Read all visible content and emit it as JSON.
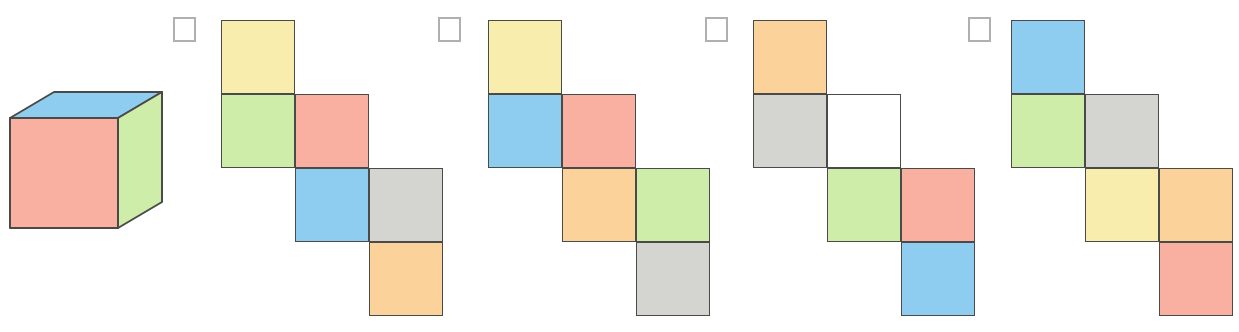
{
  "page": {
    "clipped_header_text": "",
    "square_size_px": 74,
    "option_count": 4
  },
  "palette": {
    "yellow": "#f8edad",
    "green": "#cdeda8",
    "pink": "#f9b0a1",
    "blue": "#8fcdf0",
    "gray": "#d4d4d0",
    "orange": "#fbd29a",
    "white": "#ffffff",
    "outline": "#4a4a48",
    "checkbox_border": "#b0b0ae"
  },
  "cube": {
    "name": "reference-cube",
    "faces": {
      "top": "blue",
      "front": "pink",
      "right": "green"
    },
    "position": {
      "x": 8,
      "y": 90,
      "width": 160,
      "height": 152
    }
  },
  "options": [
    {
      "id": "option-a",
      "checkbox": {
        "x": 173,
        "y": 17,
        "checked": false
      },
      "net_origin": {
        "x": 221,
        "y": 20
      },
      "cells": [
        {
          "row": 0,
          "col": 0,
          "color": "yellow"
        },
        {
          "row": 1,
          "col": 0,
          "color": "green"
        },
        {
          "row": 1,
          "col": 1,
          "color": "pink"
        },
        {
          "row": 2,
          "col": 1,
          "color": "blue"
        },
        {
          "row": 2,
          "col": 2,
          "color": "gray"
        },
        {
          "row": 3,
          "col": 2,
          "color": "orange"
        }
      ]
    },
    {
      "id": "option-b",
      "checkbox": {
        "x": 438,
        "y": 17,
        "checked": false
      },
      "net_origin": {
        "x": 488,
        "y": 20
      },
      "cells": [
        {
          "row": 0,
          "col": 0,
          "color": "yellow"
        },
        {
          "row": 1,
          "col": 0,
          "color": "blue"
        },
        {
          "row": 1,
          "col": 1,
          "color": "pink"
        },
        {
          "row": 2,
          "col": 1,
          "color": "orange"
        },
        {
          "row": 2,
          "col": 2,
          "color": "green"
        },
        {
          "row": 3,
          "col": 2,
          "color": "gray"
        }
      ]
    },
    {
      "id": "option-c",
      "checkbox": {
        "x": 705,
        "y": 17,
        "checked": false
      },
      "net_origin": {
        "x": 753,
        "y": 20
      },
      "cells": [
        {
          "row": 0,
          "col": 0,
          "color": "orange"
        },
        {
          "row": 1,
          "col": 0,
          "color": "gray"
        },
        {
          "row": 1,
          "col": 1,
          "color": "white"
        },
        {
          "row": 2,
          "col": 1,
          "color": "green"
        },
        {
          "row": 2,
          "col": 2,
          "color": "pink"
        },
        {
          "row": 3,
          "col": 2,
          "color": "blue"
        }
      ]
    },
    {
      "id": "option-d",
      "checkbox": {
        "x": 968,
        "y": 17,
        "checked": false
      },
      "net_origin": {
        "x": 1011,
        "y": 20
      },
      "cells": [
        {
          "row": 0,
          "col": 0,
          "color": "blue"
        },
        {
          "row": 1,
          "col": 0,
          "color": "green"
        },
        {
          "row": 1,
          "col": 1,
          "color": "gray"
        },
        {
          "row": 2,
          "col": 1,
          "color": "yellow"
        },
        {
          "row": 2,
          "col": 2,
          "color": "orange"
        },
        {
          "row": 3,
          "col": 2,
          "color": "pink"
        }
      ]
    }
  ]
}
